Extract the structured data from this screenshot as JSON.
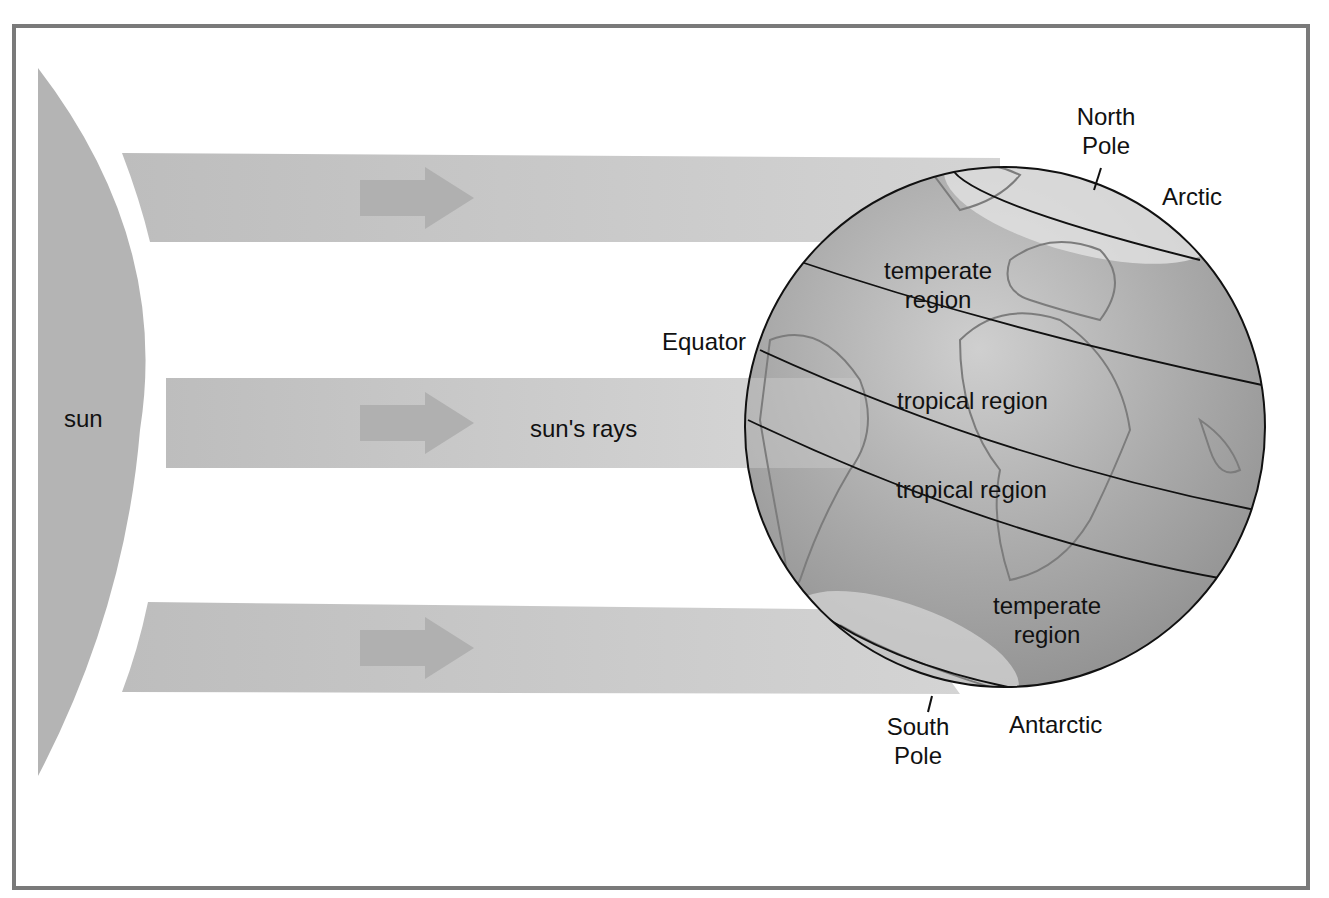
{
  "diagram": {
    "colors": {
      "frame": "#7a7a7a",
      "sun": "#b4b4b4",
      "ray": "#c2c2c2",
      "arrow": "#b0b0b0",
      "globe_dark": "#8e8e8e",
      "globe_light": "#d6d6d6",
      "text": "#111111"
    },
    "labels": {
      "sun": "sun",
      "rays": "sun's rays",
      "north_pole_line1": "North",
      "north_pole_line2": "Pole",
      "arctic": "Arctic",
      "temperate_north_line1": "temperate",
      "temperate_north_line2": "region",
      "equator": "Equator",
      "tropical_north": "tropical region",
      "tropical_south": "tropical region",
      "temperate_south_line1": "temperate",
      "temperate_south_line2": "region",
      "south_pole_line1": "South",
      "south_pole_line2": "Pole",
      "antarctic": "Antarctic"
    },
    "rays": [
      {
        "name": "upper-ray",
        "y_top": 153,
        "y_bottom": 242
      },
      {
        "name": "middle-ray",
        "y_top": 378,
        "y_bottom": 468
      },
      {
        "name": "lower-ray",
        "y_top": 602,
        "y_bottom": 694
      }
    ]
  }
}
